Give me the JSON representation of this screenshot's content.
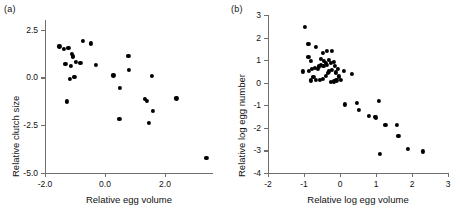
{
  "figure": {
    "panels": [
      {
        "tag": "(a)",
        "xlabel": "Relative egg volume",
        "ylabel": "Relative clutch size",
        "xticks": [
          "-2.0",
          "0.0",
          "2.0"
        ],
        "yticks": [
          "2.5",
          "0.0",
          "-2.5",
          "-5.0"
        ]
      },
      {
        "tag": "(b)",
        "xlabel": "Relative log egg volume",
        "ylabel": "Relative log egg number",
        "xticks": [
          "-2",
          "-1",
          "0",
          "1",
          "2",
          "3"
        ],
        "yticks": [
          "3",
          "2",
          "1",
          "0",
          "-1",
          "-2",
          "-3",
          "-4"
        ]
      }
    ]
  },
  "chart_data": [
    {
      "type": "scatter",
      "panel": "(a)",
      "title": "",
      "xlabel": "Relative egg volume",
      "ylabel": "Relative clutch size",
      "xlim": [
        -2.0,
        3.6
      ],
      "ylim": [
        -5.0,
        3.0
      ],
      "xticks": [
        -2.0,
        0.0,
        2.0
      ],
      "yticks": [
        2.5,
        0.0,
        -2.5,
        -5.0
      ],
      "grid": false,
      "legend": null,
      "marker": "filled-circle",
      "marker_color": "#000000",
      "points": [
        {
          "x": -1.52,
          "y": 1.62
        },
        {
          "x": -1.38,
          "y": 1.48
        },
        {
          "x": -1.32,
          "y": 0.72
        },
        {
          "x": -1.22,
          "y": 1.52
        },
        {
          "x": -1.1,
          "y": 1.22
        },
        {
          "x": -1.08,
          "y": 1.14
        },
        {
          "x": -1.06,
          "y": 1.06
        },
        {
          "x": -1.14,
          "y": 0.6
        },
        {
          "x": -1.02,
          "y": 0.02
        },
        {
          "x": -0.96,
          "y": 0.82
        },
        {
          "x": -1.18,
          "y": -0.1
        },
        {
          "x": -0.82,
          "y": 0.76
        },
        {
          "x": -0.74,
          "y": 1.92
        },
        {
          "x": -0.46,
          "y": 1.78
        },
        {
          "x": -0.3,
          "y": 0.64
        },
        {
          "x": -1.26,
          "y": -1.26
        },
        {
          "x": 0.28,
          "y": 0.1
        },
        {
          "x": 0.5,
          "y": -0.54
        },
        {
          "x": 0.48,
          "y": -2.18
        },
        {
          "x": 0.78,
          "y": 1.12
        },
        {
          "x": 0.8,
          "y": 0.38
        },
        {
          "x": 1.34,
          "y": -1.12
        },
        {
          "x": 1.4,
          "y": -1.22
        },
        {
          "x": 1.46,
          "y": -2.38
        },
        {
          "x": 1.56,
          "y": 0.06
        },
        {
          "x": 1.6,
          "y": -1.76
        },
        {
          "x": 2.38,
          "y": -1.1
        },
        {
          "x": 3.38,
          "y": -4.22
        }
      ]
    },
    {
      "type": "scatter",
      "panel": "(b)",
      "title": "",
      "xlabel": "Relative log egg volume",
      "ylabel": "Relative log egg number",
      "xlim": [
        -2,
        3
      ],
      "ylim": [
        -4,
        3
      ],
      "xticks": [
        -2,
        -1,
        0,
        1,
        2,
        3
      ],
      "yticks": [
        3,
        2,
        1,
        0,
        -1,
        -2,
        -3,
        -4
      ],
      "grid": false,
      "legend": null,
      "marker": "filled-circle",
      "marker_color": "#000000",
      "points": [
        {
          "x": -0.97,
          "y": 2.47
        },
        {
          "x": -0.88,
          "y": 1.72
        },
        {
          "x": -0.68,
          "y": 1.57
        },
        {
          "x": -0.88,
          "y": 1.14
        },
        {
          "x": -0.8,
          "y": 0.96
        },
        {
          "x": -0.47,
          "y": 1.33
        },
        {
          "x": -0.36,
          "y": 1.4
        },
        {
          "x": -0.22,
          "y": 1.42
        },
        {
          "x": -0.52,
          "y": 1.07
        },
        {
          "x": -0.44,
          "y": 0.96
        },
        {
          "x": -0.4,
          "y": 0.88
        },
        {
          "x": -0.36,
          "y": 0.8
        },
        {
          "x": -0.46,
          "y": 0.74
        },
        {
          "x": -0.52,
          "y": 0.8
        },
        {
          "x": -0.58,
          "y": 0.72
        },
        {
          "x": -0.62,
          "y": 0.62
        },
        {
          "x": -0.7,
          "y": 0.66
        },
        {
          "x": -0.78,
          "y": 0.62
        },
        {
          "x": -1.02,
          "y": 0.5
        },
        {
          "x": -0.86,
          "y": 0.52
        },
        {
          "x": -0.3,
          "y": 1.02
        },
        {
          "x": -0.26,
          "y": 0.86
        },
        {
          "x": -0.18,
          "y": 0.92
        },
        {
          "x": -0.14,
          "y": 0.74
        },
        {
          "x": -0.22,
          "y": 0.56
        },
        {
          "x": -0.3,
          "y": 0.5
        },
        {
          "x": -0.34,
          "y": 0.42
        },
        {
          "x": -0.4,
          "y": 0.3
        },
        {
          "x": -0.48,
          "y": 0.18
        },
        {
          "x": -0.56,
          "y": 0.14
        },
        {
          "x": -0.66,
          "y": 0.12
        },
        {
          "x": -0.8,
          "y": 0.1
        },
        {
          "x": -0.74,
          "y": 0.26
        },
        {
          "x": -0.12,
          "y": 0.46
        },
        {
          "x": -0.06,
          "y": 0.62
        },
        {
          "x": -0.04,
          "y": 0.28
        },
        {
          "x": -0.1,
          "y": 0.1
        },
        {
          "x": -0.18,
          "y": 0.06
        },
        {
          "x": -0.26,
          "y": 0.04
        },
        {
          "x": 0.02,
          "y": 0.12
        },
        {
          "x": 0.1,
          "y": 0.52
        },
        {
          "x": 0.34,
          "y": 0.38
        },
        {
          "x": 0.14,
          "y": -0.96
        },
        {
          "x": 0.46,
          "y": -0.88
        },
        {
          "x": 0.52,
          "y": -1.22
        },
        {
          "x": 0.8,
          "y": -1.46
        },
        {
          "x": 0.96,
          "y": -1.5
        },
        {
          "x": 1.0,
          "y": -1.54
        },
        {
          "x": 1.08,
          "y": -0.8
        },
        {
          "x": 1.1,
          "y": -3.14
        },
        {
          "x": 1.26,
          "y": -1.88
        },
        {
          "x": 1.58,
          "y": -1.86
        },
        {
          "x": 1.62,
          "y": -2.34
        },
        {
          "x": 1.88,
          "y": -2.94
        },
        {
          "x": 2.3,
          "y": -3.04
        }
      ]
    }
  ]
}
